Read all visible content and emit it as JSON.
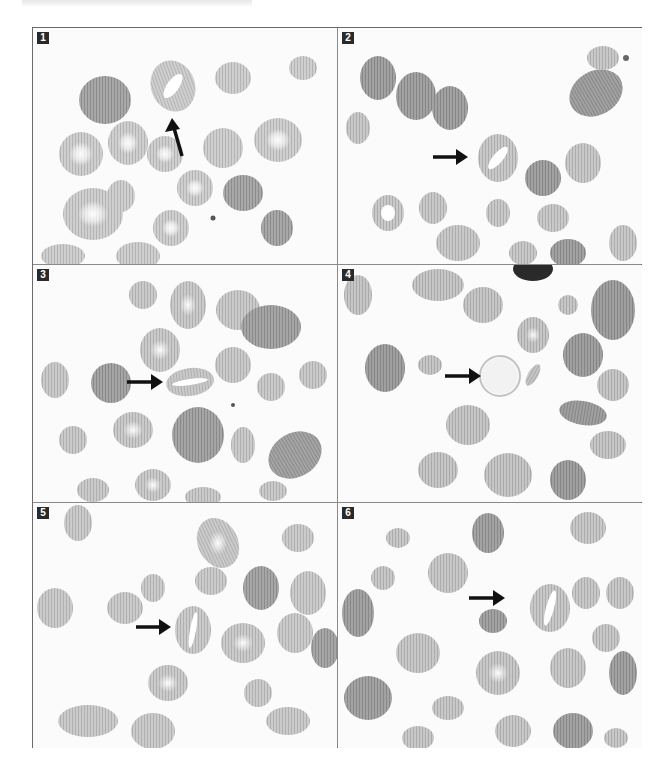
{
  "figure": {
    "panels": [
      {
        "label": "1",
        "arrow": {
          "x1": 182,
          "y1": 128,
          "x2": 174,
          "y2": 96
        }
      },
      {
        "label": "2",
        "arrow": {
          "x1": 95,
          "y1": 129,
          "x2": 130,
          "y2": 129
        }
      },
      {
        "label": "3",
        "arrow": {
          "x1": 94,
          "y1": 117,
          "x2": 130,
          "y2": 117
        }
      },
      {
        "label": "4",
        "arrow": {
          "x1": 107,
          "y1": 111,
          "x2": 143,
          "y2": 111
        }
      },
      {
        "label": "5",
        "arrow": {
          "x1": 103,
          "y1": 124,
          "x2": 138,
          "y2": 124
        }
      },
      {
        "label": "6",
        "arrow": {
          "x1": 131,
          "y1": 95,
          "x2": 167,
          "y2": 95
        }
      }
    ],
    "colors": {
      "frame": "#6a6a6a",
      "cell_fill": "#c8c8c8",
      "cell_dark": "#9a9a9a",
      "arrow": "#111111",
      "label_bg": "#2a2a2a",
      "label_text": "#ffffff"
    }
  }
}
